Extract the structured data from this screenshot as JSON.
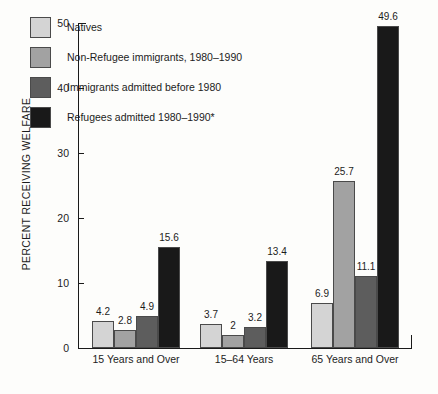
{
  "chart_data": {
    "type": "bar",
    "title": "",
    "subtitle": "",
    "xlabel": "",
    "ylabel": "PERCENT RECEIVING WELFARE",
    "ylim": [
      0,
      50
    ],
    "yticks": [
      0,
      10,
      20,
      30,
      40,
      50
    ],
    "ytick_labels": [
      "0",
      "10",
      "20",
      "30",
      "40",
      "50"
    ],
    "grid": false,
    "legend_position": "upper-left-inside",
    "categories": [
      "15 Years and Over",
      "15–64 Years",
      "65 Years and Over"
    ],
    "series": [
      {
        "name": "Natives",
        "color": "#d4d4d4",
        "values": [
          4.2,
          3.7,
          6.9
        ],
        "labels": [
          "4.2",
          "3.7",
          "6.9"
        ]
      },
      {
        "name": "Non-Refugee immigrants, 1980–1990",
        "color": "#a2a2a2",
        "values": [
          2.8,
          2,
          25.7
        ],
        "labels": [
          "2.8",
          "2",
          "25.7"
        ]
      },
      {
        "name": "Immigrants admitted before 1980",
        "color": "#5d5d5d",
        "values": [
          4.9,
          3.2,
          11.1
        ],
        "labels": [
          "4.9",
          "3.2",
          "11.1"
        ]
      },
      {
        "name": "Refugees admitted 1980–1990*",
        "color": "#191919",
        "values": [
          15.6,
          13.4,
          49.6
        ],
        "labels": [
          "15.6",
          "13.4",
          "49.6"
        ]
      }
    ],
    "annotations": [
      "*"
    ]
  },
  "axis": {
    "y_title": "PERCENT RECEIVING WELFARE"
  },
  "legend": {
    "items": [
      {
        "label": "Natives",
        "swatch": "#d4d4d4"
      },
      {
        "label": "Non-Refugee immigrants, 1980–1990",
        "swatch": "#a2a2a2"
      },
      {
        "label": "Immigrants admitted before 1980",
        "swatch": "#5d5d5d"
      },
      {
        "label": "Refugees admitted 1980–1990*",
        "swatch": "#191919"
      }
    ]
  },
  "colors": {
    "background": "#fdfdfb",
    "axis": "#1a1a1a",
    "text": "#1c1c1c",
    "bar_edge": "#4a4a4a"
  }
}
